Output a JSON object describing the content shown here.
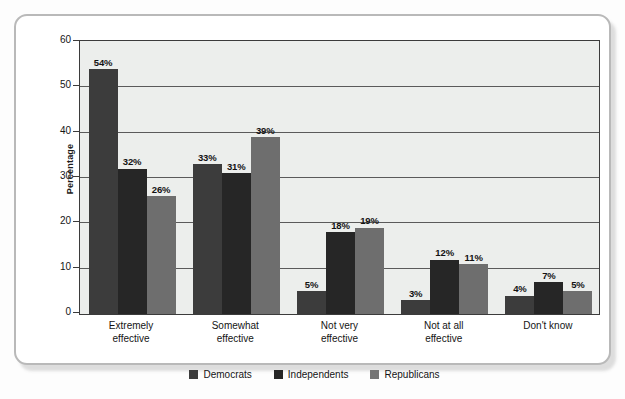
{
  "chart_data": {
    "type": "bar",
    "title": "",
    "xlabel": "",
    "ylabel": "Percentage",
    "ylim": [
      0,
      60
    ],
    "yticks": [
      0,
      10,
      20,
      30,
      40,
      50,
      60
    ],
    "grid": true,
    "legend_position": "bottom",
    "categories": [
      "Extremely\neffective",
      "Somewhat\neffective",
      "Not very\neffective",
      "Not at all\neffective",
      "Don't know"
    ],
    "series": [
      {
        "name": "Democrats",
        "values": [
          54,
          33,
          5,
          3,
          4
        ],
        "color": "#3c3c3c"
      },
      {
        "name": "Independents",
        "values": [
          32,
          31,
          18,
          12,
          7
        ],
        "color": "#262626"
      },
      {
        "name": "Republicans",
        "values": [
          26,
          39,
          19,
          11,
          5
        ],
        "color": "#6e6e6e"
      }
    ],
    "data_labels": [
      [
        "54%",
        "32%",
        "26%"
      ],
      [
        "33%",
        "31%",
        "39%"
      ],
      [
        "5%",
        "18%",
        "19%"
      ],
      [
        "3%",
        "12%",
        "11%"
      ],
      [
        "4%",
        "7%",
        "5%"
      ]
    ]
  },
  "axis": {
    "y_title": "Percentage",
    "y_tick_labels": [
      "60",
      "50",
      "40",
      "30",
      "20",
      "10",
      "0"
    ]
  },
  "legend": {
    "items": [
      {
        "label": "Democrats",
        "swatch": "swatch-democrats"
      },
      {
        "label": "Independents",
        "swatch": "swatch-independents"
      },
      {
        "label": "Republicans",
        "swatch": "swatch-republicans"
      }
    ]
  },
  "colors": {
    "democrats": "#3c3c3c",
    "independents": "#262626",
    "republicans": "#6e6e6e",
    "plot_background": "#eceeec",
    "gridline": "#5a5a5a",
    "card_border": "#b9b9b9"
  }
}
